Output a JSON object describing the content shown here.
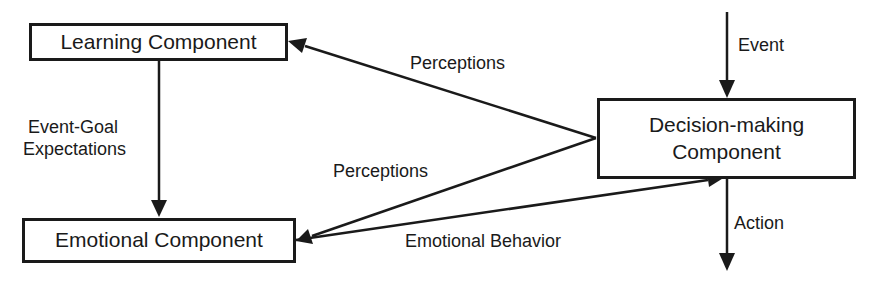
{
  "diagram": {
    "nodes": [
      {
        "id": "learning",
        "label": "Learning Component"
      },
      {
        "id": "emotional",
        "label": "Emotional Component"
      },
      {
        "id": "decision",
        "label": "Decision-making Component",
        "label_line1": "Decision-making",
        "label_line2": "Component"
      }
    ],
    "edges": [
      {
        "from": "decision",
        "to": "learning",
        "label": "Perceptions"
      },
      {
        "from": "decision",
        "to": "emotional",
        "label": "Perceptions"
      },
      {
        "from": "emotional",
        "to": "decision",
        "label": "Emotional Behavior"
      },
      {
        "from": "learning",
        "to": "emotional",
        "label": "Event-Goal Expectations",
        "label_line1": "Event-Goal",
        "label_line2": "Expectations"
      },
      {
        "from": "external",
        "to": "decision",
        "label": "Event"
      },
      {
        "from": "decision",
        "to": "external",
        "label": "Action"
      }
    ],
    "colors": {
      "stroke": "#1a1a1a",
      "background": "#ffffff"
    }
  }
}
